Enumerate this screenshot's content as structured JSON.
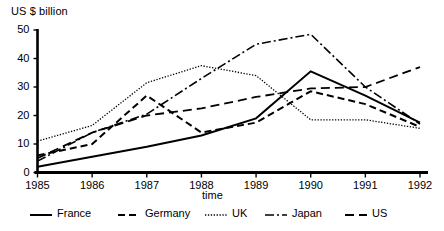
{
  "chart_data": {
    "type": "line",
    "title": "",
    "xlabel": "time",
    "ylabel": "US $ billion",
    "x": [
      1985,
      1986,
      1987,
      1988,
      1989,
      1990,
      1991,
      1992
    ],
    "xtick_labels": [
      "1985",
      "1986",
      "1987",
      "1988",
      "1989",
      "1990",
      "1991",
      "1992"
    ],
    "ytick_labels": [
      "0",
      "10",
      "20",
      "30",
      "40",
      "50"
    ],
    "yticks": [
      0,
      10,
      20,
      30,
      40,
      50
    ],
    "xlim": [
      1985,
      1992
    ],
    "ylim": [
      0,
      50
    ],
    "grid": false,
    "legend_position": "bottom",
    "series": [
      {
        "name": "France",
        "style": "solid",
        "width": 2.0,
        "color": "#000000",
        "values": [
          2,
          5.5,
          9,
          13,
          19,
          35.5,
          27,
          17.5
        ]
      },
      {
        "name": "Germany",
        "style": "dashed",
        "width": 2.0,
        "color": "#000000",
        "values": [
          6,
          10,
          27,
          14,
          17.5,
          28.5,
          24,
          16
        ]
      },
      {
        "name": "UK",
        "style": "dotted",
        "width": 1.3,
        "color": "#000000",
        "values": [
          11,
          16.5,
          31.5,
          37.5,
          34,
          18.5,
          18.5,
          15.5
        ]
      },
      {
        "name": "Japan",
        "style": "dashdot",
        "width": 1.6,
        "color": "#000000",
        "values": [
          4,
          14,
          20.5,
          33,
          45,
          48.5,
          30,
          17
        ]
      },
      {
        "name": "US",
        "style": "longdash",
        "width": 1.8,
        "color": "#000000",
        "values": [
          5,
          14,
          20,
          22.5,
          26.5,
          29.5,
          30,
          37
        ]
      }
    ]
  },
  "axes": {
    "y_axis_title": "US $ billion",
    "x_axis_title": "time",
    "y_ticks": [
      {
        "label": "50",
        "value": 50
      },
      {
        "label": "40",
        "value": 40
      },
      {
        "label": "30",
        "value": 30
      },
      {
        "label": "20",
        "value": 20
      },
      {
        "label": "10",
        "value": 10
      },
      {
        "label": "0",
        "value": 0
      }
    ],
    "x_ticks": [
      {
        "label": "1985",
        "value": 1985
      },
      {
        "label": "1986",
        "value": 1986
      },
      {
        "label": "1987",
        "value": 1987
      },
      {
        "label": "1988",
        "value": 1988
      },
      {
        "label": "1989",
        "value": 1989
      },
      {
        "label": "1990",
        "value": 1990
      },
      {
        "label": "1991",
        "value": 1991
      },
      {
        "label": "1992",
        "value": 1992
      }
    ]
  },
  "legend": {
    "entries": [
      {
        "label": "France",
        "style": "solid"
      },
      {
        "label": "Germany",
        "style": "dashed"
      },
      {
        "label": "UK",
        "style": "dotted"
      },
      {
        "label": "Japan",
        "style": "dashdot"
      },
      {
        "label": "US",
        "style": "longdash"
      }
    ]
  }
}
